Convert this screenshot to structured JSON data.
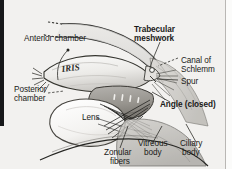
{
  "figure": {
    "background_color": "#f2f1ef",
    "ink_color": "#1a1a18",
    "edge_bar_color": "#17181a"
  },
  "labels": {
    "anterior_chamber": "Anterior chamber",
    "posterior_chamber_line1": "Posterior",
    "posterior_chamber_line2": "chamber",
    "iris": "IRIS",
    "lens": "Lens",
    "trabecular_line1": "Trabecular",
    "trabecular_line2": "meshwork",
    "canal_line1": "Canal of",
    "canal_line2": "Schlemm",
    "spur": "Spur",
    "angle_closed": "Angle (closed)",
    "zonular_line1": "Zonular",
    "zonular_line2": "fibers",
    "vitreous_line1": "Vitreous",
    "vitreous_line2": "body",
    "ciliary_line1": "Ciliary",
    "ciliary_line2": "body"
  },
  "styles": {
    "bold_labels": [
      "Trabecular meshwork",
      "Angle (closed)"
    ],
    "italic_labels": [
      "IRIS"
    ]
  }
}
